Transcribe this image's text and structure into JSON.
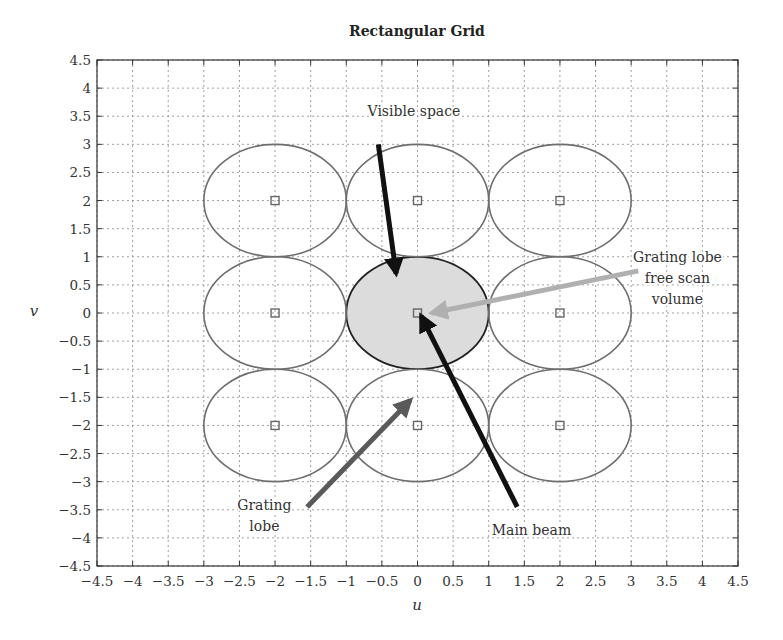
{
  "chart_data": {
    "type": "scatter",
    "title": "Rectangular Grid",
    "xlabel": "u",
    "ylabel": "v",
    "xlim": [
      -4.5,
      4.5
    ],
    "ylim": [
      -4.5,
      4.5
    ],
    "grid": true,
    "xticks": [
      -4.5,
      -4,
      -3.5,
      -3,
      -2.5,
      -2,
      -1.5,
      -1,
      -0.5,
      0,
      0.5,
      1,
      1.5,
      2,
      2.5,
      3,
      3.5,
      4,
      4.5
    ],
    "xtick_labels": [
      "−4.5",
      "−4",
      "−3.5",
      "−3",
      "−2.5",
      "−2",
      "−1.5",
      "−1",
      "−0.5",
      "0",
      "0.5",
      "1",
      "1.5",
      "2",
      "2.5",
      "3",
      "3.5",
      "4",
      "4.5"
    ],
    "yticks": [
      4.5,
      4,
      3.5,
      3,
      2.5,
      2,
      1.5,
      1,
      0.5,
      0,
      -0.5,
      -1,
      -1.5,
      -2,
      -2.5,
      -3,
      -3.5,
      -4,
      -4.5
    ],
    "ytick_labels": [
      "4.5",
      "4",
      "3.5",
      "3",
      "2.5",
      "2",
      "1.5",
      "1",
      "0.5",
      "0",
      "−0.5",
      "−1",
      "−1.5",
      "−2",
      "−2.5",
      "−3",
      "−3.5",
      "−4",
      "−4.5"
    ],
    "lattice_points": [
      {
        "u": -2,
        "v": 2
      },
      {
        "u": 0,
        "v": 2
      },
      {
        "u": 2,
        "v": 2
      },
      {
        "u": -2,
        "v": 0
      },
      {
        "u": 0,
        "v": 0
      },
      {
        "u": 2,
        "v": 0
      },
      {
        "u": -2,
        "v": -2
      },
      {
        "u": 0,
        "v": -2
      },
      {
        "u": 2,
        "v": -2
      }
    ],
    "circle_radius": 1,
    "visible_space": {
      "u": 0,
      "v": 0,
      "radius": 1,
      "fill": "#dcdcdc"
    },
    "colors": {
      "circle": "#6e6e6e",
      "marker": "#666666",
      "grid": "#888888",
      "visible_outline": "#222222"
    },
    "annotations": [
      {
        "id": "visible-space",
        "lines": [
          "Visible space"
        ],
        "text_at": [
          -0.05,
          3.5
        ],
        "arrow_from": [
          -0.55,
          3.0
        ],
        "arrow_to": [
          -0.3,
          0.7
        ],
        "color": "#111111"
      },
      {
        "id": "grating-lobe-free",
        "lines": [
          "Grating lobe",
          "free scan",
          "volume"
        ],
        "text_at": [
          3.65,
          0.9
        ],
        "arrow_from": [
          3.1,
          0.75
        ],
        "arrow_to": [
          0.2,
          0.0
        ],
        "color": "#b0b0b0"
      },
      {
        "id": "main-beam",
        "lines": [
          "Main beam"
        ],
        "text_at": [
          1.6,
          -3.95
        ],
        "arrow_from": [
          1.4,
          -3.45
        ],
        "arrow_to": [
          0.05,
          -0.05
        ],
        "color": "#111111"
      },
      {
        "id": "grating-lobe",
        "lines": [
          "Grating",
          "lobe"
        ],
        "text_at": [
          -2.15,
          -3.5
        ],
        "arrow_from": [
          -1.55,
          -3.45
        ],
        "arrow_to": [
          -0.1,
          -1.55
        ],
        "color": "#5a5a5a"
      }
    ]
  }
}
